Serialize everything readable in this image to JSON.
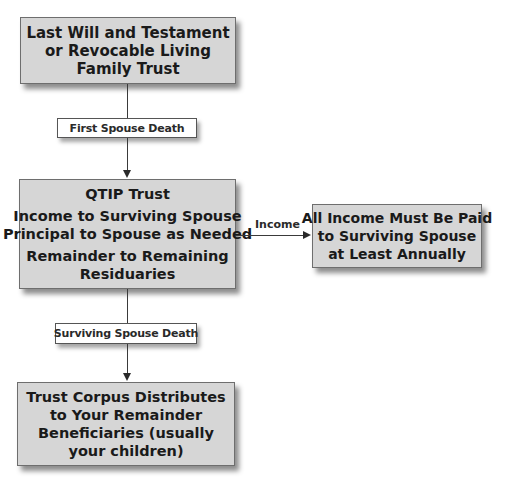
{
  "diagram": {
    "type": "flowchart",
    "nodes": {
      "will": {
        "lines": [
          "Last Will and Testament",
          "or Revocable Living",
          "Family Trust"
        ]
      },
      "qtip": {
        "title": "QTIP Trust",
        "lines": [
          "Income to Surviving Spouse",
          "Principal to Spouse as Needed"
        ],
        "remainder_lines": [
          "Remainder to Remaining",
          "Residuaries"
        ]
      },
      "income_requirement": {
        "lines": [
          "All Income Must Be Paid",
          "to Surviving Spouse",
          "at Least Annually"
        ]
      },
      "corpus": {
        "lines": [
          "Trust Corpus Distributes",
          "to Your Remainder",
          "Beneficiaries (usually",
          "your children)"
        ]
      }
    },
    "edges": {
      "first_death": {
        "from": "will",
        "to": "qtip",
        "label": "First Spouse Death"
      },
      "income": {
        "from": "qtip",
        "to": "income_requirement",
        "label": "Income"
      },
      "surviving_death": {
        "from": "qtip",
        "to": "corpus",
        "label": "Surviving Spouse Death"
      }
    }
  }
}
